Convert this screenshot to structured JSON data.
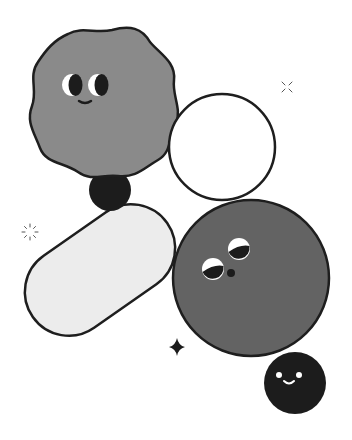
{
  "illustration": {
    "title": "Playful shapes with faces",
    "colors": {
      "background": "#ffffff",
      "outline": "#1e1e1e",
      "blob_fill": "#8a8a8a",
      "big_circle_fill": "#636363",
      "pill_fill": "#ececec",
      "ring_fill": "#ffffff",
      "dark_ball": "#1c1c1c",
      "eye_white": "#ffffff"
    },
    "shapes": [
      {
        "name": "wavy-blob",
        "face": "smiling",
        "cx": 97,
        "cy": 95
      },
      {
        "name": "small-dark-ball",
        "cx": 110,
        "cy": 190,
        "r": 21
      },
      {
        "name": "outline-circle",
        "cx": 222,
        "cy": 147,
        "r": 53
      },
      {
        "name": "pill",
        "angle": -35
      },
      {
        "name": "big-grey-circle",
        "face": "looking-up",
        "cx": 250,
        "cy": 278,
        "r": 78
      },
      {
        "name": "smiling-dark-ball",
        "face": "smiling",
        "cx": 295,
        "cy": 383,
        "r": 31
      }
    ],
    "decorations": [
      {
        "name": "sparkle-x",
        "cx": 287,
        "cy": 87
      },
      {
        "name": "sparkle-burst",
        "cx": 30,
        "cy": 232
      },
      {
        "name": "four-point-star",
        "cx": 177,
        "cy": 347
      }
    ]
  }
}
